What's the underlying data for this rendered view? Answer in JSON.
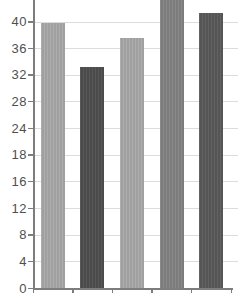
{
  "chart_data": {
    "type": "bar",
    "title": "",
    "xlabel": "",
    "ylabel": "",
    "categories": [
      "",
      "",
      "",
      "",
      ""
    ],
    "values": [
      39.8,
      33.2,
      37.5,
      44,
      41.3
    ],
    "clipped_at_top": [
      false,
      false,
      false,
      true,
      false
    ],
    "bar_colors": [
      "#a9a9a9",
      "#4f4f4f",
      "#a9a9a9",
      "#838383",
      "#5a5a5a"
    ],
    "ytick_values": [
      0,
      4,
      8,
      12,
      16,
      20,
      24,
      28,
      32,
      36,
      40
    ],
    "ytick_labels": [
      "0",
      "4",
      "8",
      "12",
      "16",
      "18",
      "24",
      "28",
      "32",
      "36",
      "40"
    ],
    "ylim": [
      0,
      43.2
    ],
    "grid": true,
    "legend": "none"
  },
  "colors": {
    "background": "#ffffff",
    "grid": "#dcdcdc",
    "axis": "#7d7d7d",
    "tick_label": "#4f4f4f"
  }
}
